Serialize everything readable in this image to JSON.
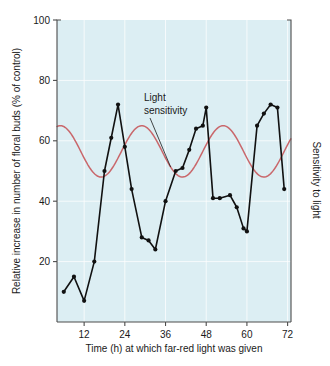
{
  "chart_data": {
    "type": "line",
    "title": "",
    "xlabel": "Time (h) at which far-red light was given",
    "ylabel": "Relative increase in number of floral buds (% of control)",
    "y2label": "Sensitivity to light",
    "xlim": [
      4,
      73
    ],
    "ylim": [
      0,
      100
    ],
    "xticks": [
      12,
      24,
      36,
      48,
      60,
      72
    ],
    "yticks": [
      20,
      40,
      60,
      80,
      100
    ],
    "xtick_labels": [
      "12",
      "24",
      "36",
      "48",
      "60",
      "72"
    ],
    "ytick_labels": [
      "20",
      "40",
      "60",
      "80",
      "100"
    ],
    "grid": true,
    "legend_position": "none",
    "plot_background": "#dceef3",
    "series": [
      {
        "name": "Relative increase in number of floral buds",
        "type": "line-markers",
        "color": "#111111",
        "marker": "circle",
        "x": [
          6,
          9,
          12,
          15,
          18,
          20,
          22,
          24,
          26,
          29,
          31,
          33,
          36,
          39,
          41,
          43,
          45,
          47,
          48,
          50,
          52,
          55,
          57,
          59,
          60,
          63,
          65,
          67,
          69,
          71
        ],
        "y": [
          10,
          15,
          7,
          20,
          50,
          61,
          72,
          58,
          44,
          28,
          27,
          24,
          40,
          50,
          51,
          57,
          64,
          65,
          71,
          41,
          41,
          42,
          38,
          31,
          30,
          65,
          69,
          72,
          71,
          44
        ]
      },
      {
        "name": "Light sensitivity",
        "type": "smooth-line",
        "color": "#c9676b",
        "description": "Smooth sinusoidal rhythm, period 24 h, maxima ~65, minima ~48",
        "amplitude": 8.5,
        "midline": 56.5,
        "period_hours": 24,
        "peak_hours": [
          5,
          29,
          53,
          77
        ],
        "trough_hours": [
          17,
          41,
          65
        ]
      }
    ],
    "annotations": [
      {
        "text_line1": "Light",
        "text_line2": "sensitivity",
        "points_to_series": "Light sensitivity",
        "x": 31,
        "y": 80
      }
    ]
  },
  "axes": {
    "left_title": "Relative increase in number of floral buds (% of control)",
    "bottom_title": "Time (h) at which far-red light was given",
    "right_title": "Sensitivity to light"
  },
  "colors": {
    "plot_background": "#dceef3",
    "data_line": "#111111",
    "sensitivity_curve": "#c9676b",
    "axis": "#4c4c4c",
    "gridline": "#ffffff",
    "text": "#1a1a1a"
  }
}
